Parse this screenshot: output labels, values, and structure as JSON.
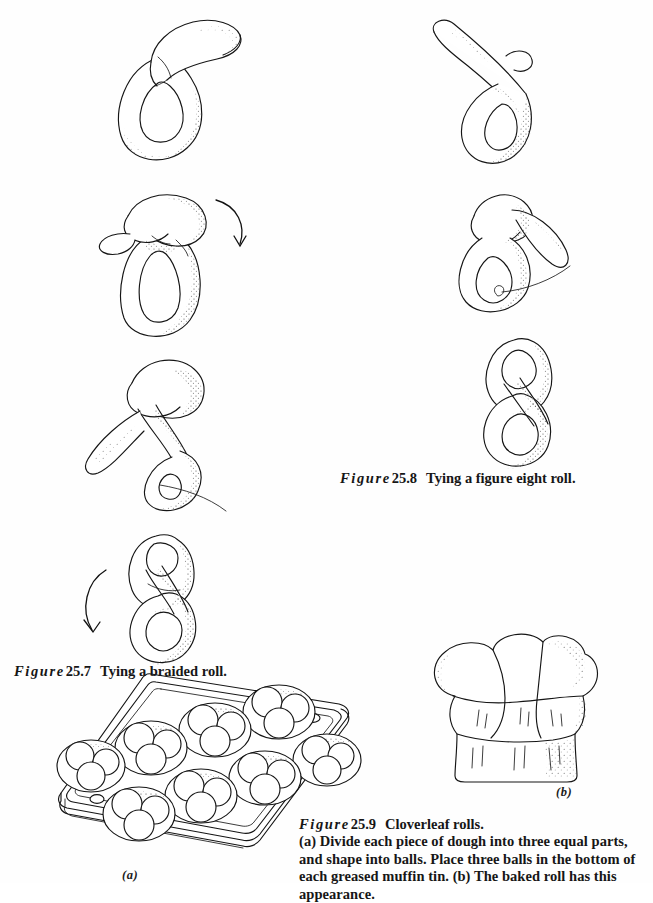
{
  "page": {
    "kind": "textbook-illustration-page",
    "background_color": "#fefefe",
    "ink_color": "#151515",
    "width": 653,
    "height": 883
  },
  "figures": [
    {
      "id": "fig-25-7",
      "number": "25.7",
      "figure_word": "Figure",
      "title": "Tying a braided roll.",
      "steps": 4,
      "step_names": [
        "dough-rope-single-loop",
        "dough-rope-loop-pulled-through",
        "dough-rope-second-tuck",
        "dough-rope-finished-braid"
      ],
      "arrows": [
        "curved-arrow-down-right",
        "curved-arrow-down-left"
      ]
    },
    {
      "id": "fig-25-8",
      "number": "25.8",
      "figure_word": "Figure",
      "title": "Tying a figure eight roll.",
      "steps": 3,
      "step_names": [
        "figure-eight-rope-loop",
        "figure-eight-end-through-loop",
        "figure-eight-finished-roll"
      ]
    },
    {
      "id": "fig-25-9",
      "number": "25.9",
      "figure_word": "Figure",
      "title": "Cloverleaf rolls.",
      "body": "(a) Divide each piece of dough into three equal parts, and shape into balls. Place three balls in the bottom of each greased muffin tin. (b) The baked roll has this appearance.",
      "panel_labels": {
        "a": "(a)",
        "b": "(b)"
      },
      "muffin_tin": {
        "cups": 8,
        "balls_per_cup": 3,
        "rows": 2,
        "columns": 4
      },
      "baked_roll": {
        "lobes": 3,
        "name": "cloverleaf-roll"
      }
    }
  ]
}
